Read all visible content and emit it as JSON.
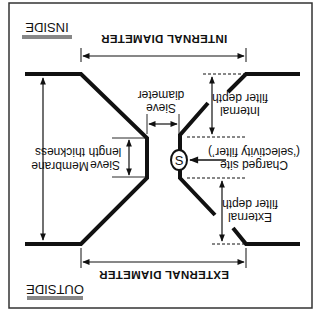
{
  "diagram": {
    "orientation": "rotated-180",
    "colors": {
      "ink": "#111111",
      "background": "#ffffff"
    },
    "sides": {
      "inside": "INSIDE",
      "outside": "OUTSIDE"
    },
    "dimensions": {
      "internal_diameter": "INTERNAL DIAMETER",
      "external_diameter": "EXTERNAL DIAMETER"
    },
    "labels": {
      "membrane_thickness": [
        "Membrane",
        "thickness"
      ],
      "sieve_length": [
        "Sieve",
        "length"
      ],
      "sieve_diameter": [
        "Sieve",
        "diameter"
      ],
      "internal_filter_depth": [
        "Internal",
        "filter depth"
      ],
      "charged_site": [
        "Charged site",
        "(‘selectivity filter’)"
      ],
      "external_filter_depth": [
        "External",
        "filter depth"
      ]
    },
    "symbols": {
      "charged_site_marker": "S"
    }
  }
}
